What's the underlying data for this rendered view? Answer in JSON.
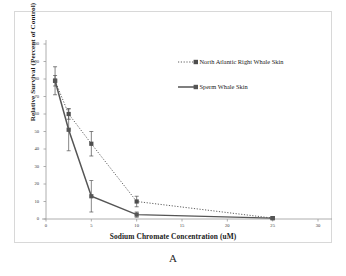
{
  "figure": {
    "panel_letter": "A"
  },
  "chart_data": {
    "type": "line",
    "title": "",
    "xlabel": "Sodium Chromate Concentration (uM)",
    "ylabel": "Relative Survival (Percent of Control)",
    "xlim": [
      0,
      30
    ],
    "ylim": [
      0,
      100
    ],
    "xticks": [
      0,
      5,
      10,
      15,
      20,
      25,
      30
    ],
    "xtick_labels": [
      "0",
      "5",
      "10",
      "15",
      "20",
      "25",
      "30"
    ],
    "yticks": [
      0,
      10,
      20,
      30,
      40,
      50,
      60,
      70,
      80,
      90,
      100
    ],
    "ytick_labels": [
      "0",
      "10",
      "20",
      "30",
      "40",
      "50",
      "60",
      "70",
      "80",
      "90",
      "100"
    ],
    "grid": false,
    "legend_position": "upper right",
    "error_bars": "symmetric",
    "series": [
      {
        "name": "North Atlantic Right Whale Skin",
        "line_style": "dotted",
        "marker": "square",
        "color": "#4d4d4d",
        "x": [
          1,
          2.5,
          5,
          10,
          25
        ],
        "values": [
          79,
          60,
          43,
          10,
          0.5
        ],
        "errors": [
          8,
          3,
          7,
          3,
          0.5
        ]
      },
      {
        "name": "Sperm Whale Skin",
        "line_style": "solid",
        "marker": "square",
        "color": "#555555",
        "x": [
          1,
          2.5,
          5,
          10,
          25
        ],
        "values": [
          79,
          51,
          13,
          2.5,
          0.5
        ],
        "errors": [
          3,
          12,
          9,
          1.5,
          0.5
        ]
      }
    ]
  },
  "legend": {
    "items": [
      {
        "label": "North Atlantic Right Whale Skin",
        "style": "dotted"
      },
      {
        "label": "Sperm Whale Skin",
        "style": "solid"
      }
    ]
  },
  "colors": {
    "axis": "#9a9a9a",
    "frame": "#d8d8d8",
    "series_1": "#4d4d4d",
    "series_2": "#555555",
    "text": "#1a1a1a"
  }
}
